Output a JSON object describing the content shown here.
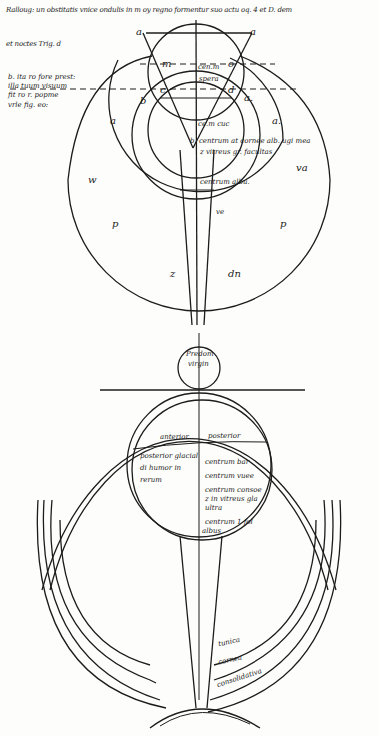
{
  "header": {
    "line1": "Ralloug: un obstitatis vnice ondulis in m oy regno formentur suo actu oq. 4 et D. dem",
    "line2": "et noctes Trig. d"
  },
  "side_note": {
    "lines": [
      "b. ita ro fore prest:",
      "illa tuum visuum",
      "fit ro r. popme",
      "vrle fig. eo:"
    ]
  },
  "upper_eye": {
    "points": {
      "a_left": "a.",
      "a_right": "a",
      "m": "m",
      "o": "o",
      "c": "c",
      "d": "d",
      "a_mid": "a.",
      "b": "b",
      "b_left": "b"
    },
    "labels": {
      "center_top": "cen.m",
      "center_sub": "spera",
      "cuc": "ce.m cuc",
      "b_note1": "b. centrum at cornee alb. ugi mea",
      "b_note2": "z vitreus gr. facultas",
      "albu": "centrum albu.",
      "ve": "ve",
      "l_outer": "w",
      "r_outer": "va",
      "p_left": "p",
      "p_right": "p",
      "a_left_ring": "a",
      "a_right_ring": "a.",
      "z": "z",
      "dn": "dn"
    }
  },
  "lower_eye": {
    "lens_label1": "Predom",
    "lens_label2": "virgin",
    "left_hemi": "anterior",
    "right_hemi": "posterior",
    "left_note": [
      "posterior glacial",
      "di humor in",
      "rerum"
    ],
    "right_marks": [
      "centrum bar",
      "centrum vuee",
      "centrum consoe",
      "z in vitreus gla",
      "ultra",
      "centrum 1 fol",
      "albus"
    ],
    "tunics": [
      "tunica",
      "cornea",
      "consolidativa"
    ]
  }
}
